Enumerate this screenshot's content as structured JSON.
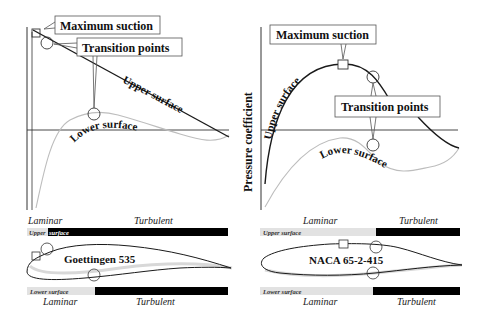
{
  "left_panel": {
    "callouts": {
      "max_suction": "Maximum suction",
      "transition_points": "Transition points"
    },
    "curve_labels": {
      "upper": "Upper surface",
      "lower": "Lower surface"
    },
    "airfoil_name": "Goettingen 535",
    "upper_bar": {
      "top_labels": {
        "laminar": "Laminar",
        "turbulent": "Turbulent"
      },
      "inline_label_light": "Upper",
      "inline_label_dark": "surface"
    },
    "lower_bar": {
      "inline_label": "Lower surface",
      "bottom_labels": {
        "laminar": "Laminar",
        "turbulent": "Turbulent"
      }
    }
  },
  "right_panel": {
    "y_axis_label": "Pressure coefficient",
    "callouts": {
      "max_suction": "Maximum suction",
      "transition_points": "Transition points"
    },
    "curve_labels": {
      "upper": "Upper surface",
      "lower": "Lower surface"
    },
    "airfoil_name": "NACA 65-2-415",
    "upper_bar": {
      "top_labels": {
        "laminar": "Laminar",
        "turbulent": "Turbulent"
      },
      "inline_label": "Upper surface"
    },
    "lower_bar": {
      "inline_label": "Lower surface",
      "bottom_labels": {
        "laminar": "Laminar",
        "turbulent": "Turbulent"
      }
    }
  },
  "colors": {
    "laminar_bar": "#e2e2e2",
    "turbulent_bar": "#000000",
    "upper_curve": "#1a1a1a",
    "lower_curve": "#bdbdbd",
    "callout_border": "#555555"
  }
}
